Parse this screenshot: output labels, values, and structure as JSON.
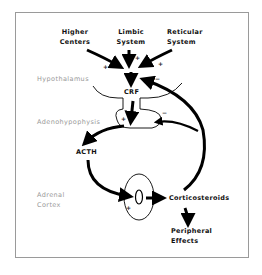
{
  "diagram": {
    "inputs": [
      {
        "line1": "Higher",
        "line2": "Centers"
      },
      {
        "line1": "Limbic",
        "line2": "System"
      },
      {
        "line1": "Reticular",
        "line2": "System"
      }
    ],
    "regions": {
      "hypothalamus": "Hypothalamus",
      "adenohypophysis": "Adenohypophysis",
      "adrenal_line1": "Adrenal",
      "adrenal_line2": "Cortex"
    },
    "nodes": {
      "crf": "CRF",
      "acth": "ACTH",
      "corticosteroids": "Corticosteroids",
      "peripheral_line1": "Peripheral",
      "peripheral_line2": "Effects"
    },
    "signs": {
      "higher_plus": "+",
      "limbic_plus": "+",
      "reticular_plus": "+",
      "hypothalamus_minus": "−",
      "pituitary_plus": "+",
      "pituitary_minus": "−",
      "adrenal_plus": "+"
    }
  }
}
